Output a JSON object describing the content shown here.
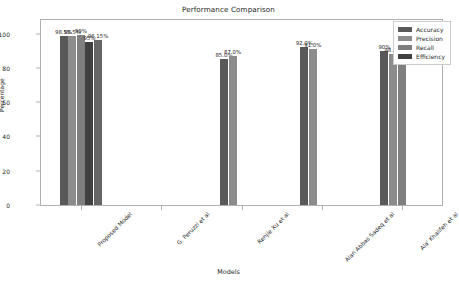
{
  "chart_data": {
    "type": "bar",
    "title": "Performance Comparison",
    "xlabel": "Models",
    "ylabel": "Percentage",
    "ylim": [
      0,
      108
    ],
    "yticks": [
      0,
      20,
      40,
      60,
      80,
      100
    ],
    "grid": false,
    "legend_position": "upper right",
    "categories": [
      "Proposed Model",
      "G. Peruzzi et al",
      "Renjie Xu et al",
      "Alan Abbas Sadeq et al",
      "Ala' Khalifeh et al"
    ],
    "series": [
      {
        "name": "Accuracy",
        "color": "#595959",
        "values": [
          98.5,
          null,
          85.0,
          92.0,
          90.0
        ],
        "labels": [
          "98.5%",
          "",
          "85.0%",
          "92.0%",
          "90%"
        ]
      },
      {
        "name": "Precision",
        "color": "#8c8c8c",
        "values": [
          98.5,
          null,
          87.0,
          91.0,
          88.0
        ],
        "labels": [
          "98.5%",
          "",
          "87.0%",
          "91.0%",
          "88.0%"
        ]
      },
      {
        "name": "Recall",
        "color": "#7f7f7f",
        "values": [
          99.0,
          null,
          null,
          null,
          89.0
        ],
        "labels": [
          "99%",
          "",
          "",
          "",
          "89.0%"
        ]
      },
      {
        "name": "Efficiency",
        "color": "#404040",
        "values": [
          95.0,
          null,
          null,
          null,
          null
        ],
        "labels": [
          "95%",
          "",
          "",
          "",
          ""
        ]
      },
      {
        "name": "Extra",
        "color": "#666666",
        "values": [
          96.15,
          null,
          null,
          null,
          null
        ],
        "labels": [
          "96.15%",
          "",
          "",
          "",
          ""
        ]
      }
    ],
    "legend_entries": [
      "Accuracy",
      "Precision",
      "Recall",
      "Efficiency"
    ],
    "legend_colors": [
      "#595959",
      "#8c8c8c",
      "#7f7f7f",
      "#404040"
    ]
  }
}
